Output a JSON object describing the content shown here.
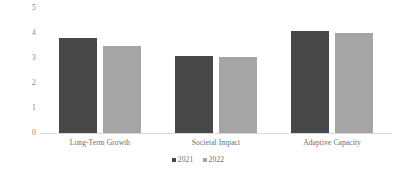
{
  "chart_data": {
    "type": "bar",
    "title": "",
    "subtitle": "",
    "xlabel": "",
    "ylabel": "",
    "grid": false,
    "legend_position": "bottom",
    "categories": [
      "Long-Term Growth",
      "Societal Impact",
      "Adaptive Capacity"
    ],
    "ylim": [
      0,
      5
    ],
    "yticks": [
      "0",
      "1",
      "2",
      "3",
      "4",
      "5"
    ],
    "series": [
      {
        "name": "2021",
        "color": "#484848",
        "values": [
          3.8,
          3.1,
          4.1
        ]
      },
      {
        "name": "2022",
        "color": "#a5a5a5",
        "values": [
          3.5,
          3.05,
          4.0
        ]
      }
    ]
  },
  "axis": {
    "y_tick_labels": [
      "5",
      "4",
      "3",
      "2",
      "1",
      "0"
    ]
  },
  "legend": {
    "items": [
      {
        "label": "2021",
        "swatch_name": "legend-swatch-2021"
      },
      {
        "label": "2022",
        "swatch_name": "legend-swatch-2022"
      }
    ]
  },
  "colors": {
    "series_2021": "#484848",
    "series_2022": "#a5a5a5",
    "axis_line": "#d9d9d9",
    "tick_text": "#7f7f7f",
    "category_text": "#6b6b6b",
    "background": "#ffffff"
  }
}
